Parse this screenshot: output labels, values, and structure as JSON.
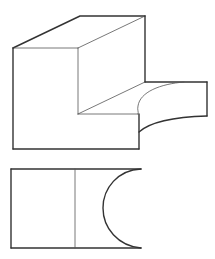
{
  "figure": {
    "background": "#ffffff",
    "stroke_color": "#333333",
    "thin_stroke_color": "#555555",
    "views": [
      {
        "name": "isometric-view",
        "description": "3D pictorial of stepped block with concave cylindrical cut on lower step"
      },
      {
        "name": "top-view",
        "description": "Orthographic top view with step line and semicircular concave cut"
      }
    ]
  }
}
